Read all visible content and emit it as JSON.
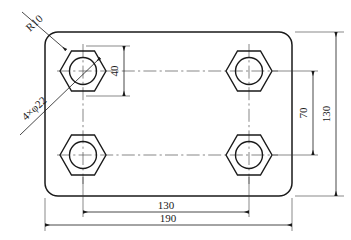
{
  "drawing": {
    "type": "engineering-drawing",
    "view": "plan-view",
    "part": "rectangular-plate-with-four-hex-bosses",
    "units": "mm",
    "plate": {
      "width": 190,
      "height": 130,
      "corner_radius": 10
    },
    "holes": {
      "count": 4,
      "diameter": 22,
      "hex_across_flats": 40,
      "spacing_x": 130,
      "spacing_y": 70
    }
  },
  "annotations": {
    "corner_radius": {
      "label": "R10",
      "name": "corner-radius-note"
    },
    "holes_note": {
      "label": "4×φ22",
      "name": "hole-callout-note"
    }
  },
  "dimensions": [
    {
      "id": "hex-across-flats",
      "label": "40",
      "orientation": "vertical",
      "position": "top-left-hex"
    },
    {
      "id": "hole-pitch-y",
      "label": "70",
      "orientation": "vertical",
      "position": "right-inner"
    },
    {
      "id": "plate-height",
      "label": "130",
      "orientation": "vertical",
      "position": "right-outer"
    },
    {
      "id": "hole-pitch-x",
      "label": "130",
      "orientation": "horizontal",
      "position": "bottom-inner"
    },
    {
      "id": "plate-width",
      "label": "190",
      "orientation": "horizontal",
      "position": "bottom-outer"
    }
  ],
  "colors": {
    "line": "#1a1a1a",
    "thin_line": "#3a3a3a",
    "centerline": "#555555",
    "background": "#ffffff"
  }
}
